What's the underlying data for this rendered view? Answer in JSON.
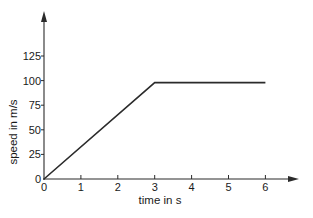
{
  "chart_data": {
    "type": "line",
    "title": "",
    "xlabel": "time in s",
    "ylabel": "speed in m/s",
    "x": [
      0,
      3,
      6
    ],
    "values": [
      0,
      98,
      98
    ],
    "series": [
      {
        "name": "speed",
        "x": [
          0,
          3,
          6
        ],
        "values": [
          0,
          98,
          98
        ],
        "color": "#2b2b2b"
      }
    ],
    "xticks": [
      "0",
      "1",
      "2",
      "3",
      "4",
      "5",
      "6"
    ],
    "yticks": [
      "0",
      "25",
      "50",
      "75",
      "100",
      "125"
    ],
    "xlim": [
      0,
      6.9
    ],
    "ylim": [
      0,
      170
    ],
    "grid": false,
    "legend": null,
    "axis_arrows": true
  },
  "colors": {
    "axis": "#2b2b2b",
    "line": "#2b2b2b",
    "text": "#1a1a1a",
    "background": "#ffffff"
  }
}
